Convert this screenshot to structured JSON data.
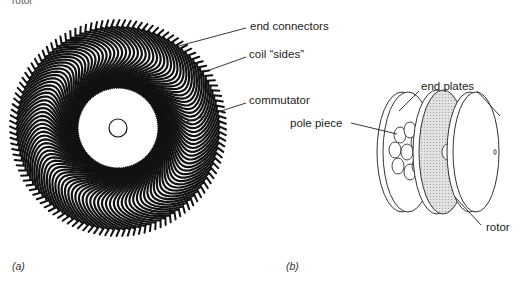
{
  "header": {
    "partial_text": "rotor"
  },
  "panel_a": {
    "caption": "(a)",
    "labels": {
      "end_connectors": "end connectors",
      "coil_sides": "coil “sides”",
      "commutator": "commutator"
    }
  },
  "panel_b": {
    "caption": "(b)",
    "labels": {
      "end_plates": "end plates",
      "pole_piece": "pole piece",
      "rotor": "rotor"
    }
  }
}
